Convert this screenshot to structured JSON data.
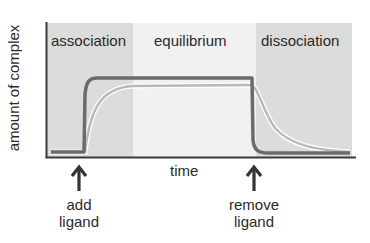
{
  "diagram": {
    "y_axis_label": "amount of complex",
    "x_axis_label": "time",
    "phases": [
      {
        "name": "association",
        "shade": "#dcdcdc"
      },
      {
        "name": "equilibrium",
        "shade": "#f1f1f1"
      },
      {
        "name": "dissociation",
        "shade": "#dcdcdc"
      }
    ],
    "curves": [
      {
        "name": "fast-kinetics",
        "color": "#6b6b6b"
      },
      {
        "name": "slow-kinetics",
        "color": "#b9b9b9"
      }
    ],
    "events": [
      {
        "label_line1": "add",
        "label_line2": "ligand"
      },
      {
        "label_line1": "remove",
        "label_line2": "ligand"
      }
    ],
    "axis_color": "#3a3a3a",
    "arrow_color": "#333333"
  }
}
